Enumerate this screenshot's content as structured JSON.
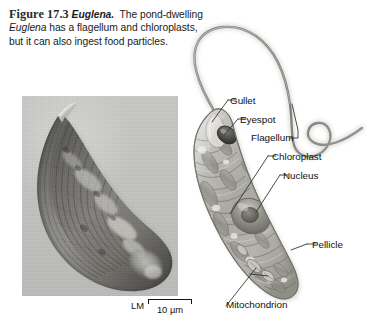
{
  "figure": {
    "number": "Figure 17.3",
    "organism": "Euglena.",
    "caption_part1": "The pond-dwelling ",
    "caption_organism_italic": "Euglena",
    "caption_part2": " has a flagellum and chloroplasts, but it can also ingest food particles."
  },
  "micrograph": {
    "technique_label": "LM",
    "scale_value": "10 µm"
  },
  "labels": {
    "gullet": "Gullet",
    "eyespot": "Eyespot",
    "flagellum": "Flagellum",
    "chloroplast": "Chloroplast",
    "nucleus": "Nucleus",
    "pellicle": "Pellicle",
    "mitochondrion": "Mitochondrion"
  },
  "colors": {
    "text": "#111111",
    "photo_background": "#c4c4c2",
    "illustration_line": "#6e6e6e",
    "illustration_fill": "#b6b6b4",
    "leader_line": "#2b2b2b"
  }
}
